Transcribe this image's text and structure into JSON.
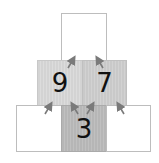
{
  "diagram": {
    "type": "number-pyramid",
    "rows": [
      {
        "row": "top",
        "cells": [
          {
            "value": "",
            "shade": "white"
          }
        ]
      },
      {
        "row": "middle",
        "cells": [
          {
            "value": "9",
            "shade": "light-gray"
          },
          {
            "value": "7",
            "shade": "gray"
          }
        ]
      },
      {
        "row": "bottom",
        "cells": [
          {
            "value": "",
            "shade": "white"
          },
          {
            "value": "3",
            "shade": "dark-gray"
          },
          {
            "value": "",
            "shade": "white"
          }
        ]
      }
    ],
    "arrow_color": "#7a7a7a",
    "arrows": 6
  }
}
